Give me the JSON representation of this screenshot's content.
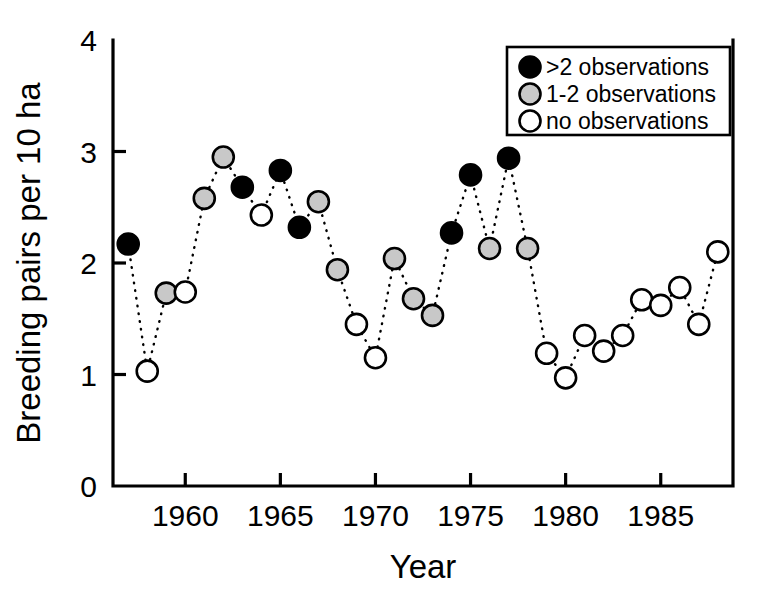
{
  "chart_data": {
    "type": "scatter",
    "title": "",
    "xlabel": "Year",
    "ylabel": "Breeding pairs per 10 ha",
    "xlim": [
      1956.2,
      1988.8
    ],
    "ylim": [
      0,
      4
    ],
    "grid": false,
    "connected": true,
    "connector_style": "dotted",
    "xticks": [
      1960,
      1965,
      1970,
      1975,
      1980,
      1985
    ],
    "xtick_labels": [
      "1960",
      "1965",
      "1970",
      "1975",
      "1980",
      "1985"
    ],
    "yticks": [
      0,
      1,
      2,
      3,
      4
    ],
    "ytick_labels": [
      "0",
      "1",
      "2",
      "3",
      "4"
    ],
    "legend_position": "top-right",
    "legend": [
      {
        "label": ">2 observations",
        "marker": "filled-black",
        "fill": "#000000"
      },
      {
        "label": "1-2 observations",
        "marker": "filled-gray",
        "fill": "#c8c8c8"
      },
      {
        "label": "no observations",
        "marker": "open-white",
        "fill": "#ffffff"
      }
    ],
    "x": [
      1957,
      1958,
      1959,
      1960,
      1961,
      1962,
      1963,
      1964,
      1965,
      1966,
      1967,
      1968,
      1969,
      1970,
      1971,
      1972,
      1973,
      1974,
      1975,
      1976,
      1977,
      1978,
      1979,
      1980,
      1981,
      1982,
      1983,
      1984,
      1985,
      1986,
      1987,
      1988
    ],
    "values": [
      2.17,
      1.03,
      1.73,
      1.74,
      2.58,
      2.95,
      2.68,
      2.43,
      2.83,
      2.32,
      2.55,
      1.94,
      1.45,
      1.15,
      2.04,
      1.68,
      1.53,
      2.27,
      2.79,
      2.13,
      2.94,
      2.13,
      1.19,
      0.97,
      1.35,
      1.21,
      1.35,
      1.67,
      1.62,
      1.78,
      1.45,
      2.1
    ],
    "categories_fill": [
      "black",
      "white",
      "gray",
      "white",
      "gray",
      "gray",
      "black",
      "white",
      "black",
      "black",
      "gray",
      "gray",
      "white",
      "white",
      "gray",
      "gray",
      "gray",
      "black",
      "black",
      "gray",
      "black",
      "gray",
      "white",
      "white",
      "white",
      "white",
      "white",
      "white",
      "white",
      "white",
      "white",
      "white"
    ],
    "points": [
      {
        "year": 1957,
        "value": 2.17,
        "observations": ">2"
      },
      {
        "year": 1958,
        "value": 1.03,
        "observations": "no"
      },
      {
        "year": 1959,
        "value": 1.73,
        "observations": "1-2"
      },
      {
        "year": 1960,
        "value": 1.74,
        "observations": "no"
      },
      {
        "year": 1961,
        "value": 2.58,
        "observations": "1-2"
      },
      {
        "year": 1962,
        "value": 2.95,
        "observations": "1-2"
      },
      {
        "year": 1963,
        "value": 2.68,
        "observations": ">2"
      },
      {
        "year": 1964,
        "value": 2.43,
        "observations": "no"
      },
      {
        "year": 1965,
        "value": 2.83,
        "observations": ">2"
      },
      {
        "year": 1966,
        "value": 2.32,
        "observations": ">2"
      },
      {
        "year": 1967,
        "value": 2.55,
        "observations": "1-2"
      },
      {
        "year": 1968,
        "value": 1.94,
        "observations": "1-2"
      },
      {
        "year": 1969,
        "value": 1.45,
        "observations": "no"
      },
      {
        "year": 1970,
        "value": 1.15,
        "observations": "no"
      },
      {
        "year": 1971,
        "value": 2.04,
        "observations": "1-2"
      },
      {
        "year": 1972,
        "value": 1.68,
        "observations": "1-2"
      },
      {
        "year": 1973,
        "value": 1.53,
        "observations": "1-2"
      },
      {
        "year": 1974,
        "value": 2.27,
        "observations": ">2"
      },
      {
        "year": 1975,
        "value": 2.79,
        "observations": ">2"
      },
      {
        "year": 1976,
        "value": 2.13,
        "observations": "1-2"
      },
      {
        "year": 1977,
        "value": 2.94,
        "observations": ">2"
      },
      {
        "year": 1978,
        "value": 2.13,
        "observations": "1-2"
      },
      {
        "year": 1979,
        "value": 1.19,
        "observations": "no"
      },
      {
        "year": 1980,
        "value": 0.97,
        "observations": "no"
      },
      {
        "year": 1981,
        "value": 1.35,
        "observations": "no"
      },
      {
        "year": 1982,
        "value": 1.21,
        "observations": "no"
      },
      {
        "year": 1983,
        "value": 1.35,
        "observations": "no"
      },
      {
        "year": 1984,
        "value": 1.67,
        "observations": "no"
      },
      {
        "year": 1985,
        "value": 1.62,
        "observations": "no"
      },
      {
        "year": 1986,
        "value": 1.78,
        "observations": "no"
      },
      {
        "year": 1987,
        "value": 1.45,
        "observations": "no"
      },
      {
        "year": 1988,
        "value": 2.1,
        "observations": "no"
      }
    ]
  },
  "colors": {
    "filled": "#000000",
    "partial": "#c8c8c8",
    "empty": "#ffffff",
    "axis": "#000000",
    "background": "#ffffff"
  },
  "geometry": {
    "plot_left": 113,
    "plot_right": 733,
    "plot_top": 40,
    "plot_bottom": 486,
    "marker_radius": 10.5,
    "legend_x": 507,
    "legend_y": 47,
    "legend_w": 223,
    "legend_h": 88
  }
}
